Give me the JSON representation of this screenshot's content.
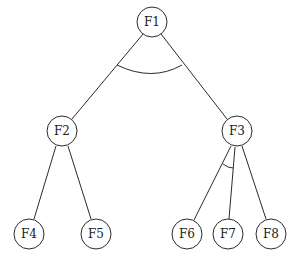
{
  "diagram": {
    "type": "and-or-tree",
    "style": {
      "stroke": "#2a2a2a",
      "node_fill": "#ffffff",
      "text": "#1a1a1a"
    },
    "nodes": [
      {
        "id": "F1",
        "label": "F1",
        "x": 152,
        "y": 22
      },
      {
        "id": "F2",
        "label": "F2",
        "x": 62,
        "y": 131
      },
      {
        "id": "F3",
        "label": "F3",
        "x": 237,
        "y": 131
      },
      {
        "id": "F4",
        "label": "F4",
        "x": 29,
        "y": 234
      },
      {
        "id": "F5",
        "label": "F5",
        "x": 96,
        "y": 234
      },
      {
        "id": "F6",
        "label": "F6",
        "x": 187,
        "y": 234
      },
      {
        "id": "F7",
        "label": "F7",
        "x": 228,
        "y": 234
      },
      {
        "id": "F8",
        "label": "F8",
        "x": 271,
        "y": 234
      }
    ],
    "edges": [
      {
        "from": "F1",
        "to": "F2"
      },
      {
        "from": "F1",
        "to": "F3"
      },
      {
        "from": "F2",
        "to": "F4"
      },
      {
        "from": "F2",
        "to": "F5"
      },
      {
        "from": "F3",
        "to": "F6"
      },
      {
        "from": "F3",
        "to": "F7"
      },
      {
        "from": "F3",
        "to": "F8"
      }
    ],
    "and_arcs": [
      {
        "parent": "F1",
        "children": [
          "F2",
          "F3"
        ]
      },
      {
        "parent": "F3",
        "children": [
          "F6",
          "F7"
        ]
      }
    ]
  }
}
